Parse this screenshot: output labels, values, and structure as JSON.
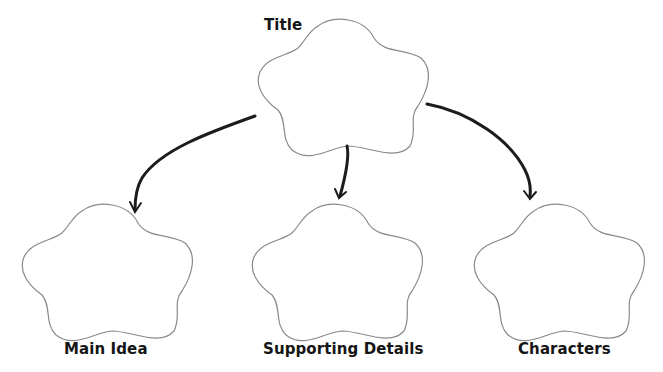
{
  "diagram": {
    "type": "graphic-organizer",
    "colors": {
      "cloud_stroke": "#8a8a8a",
      "arrow": "#1c1c1c",
      "text": "#151515",
      "background": "#ffffff"
    },
    "nodes": [
      {
        "id": "title",
        "label": "Title"
      },
      {
        "id": "main-idea",
        "label": "Main Idea"
      },
      {
        "id": "supporting-details",
        "label": "Supporting Details"
      },
      {
        "id": "characters",
        "label": "Characters"
      }
    ],
    "edges": [
      {
        "from": "title",
        "to": "main-idea"
      },
      {
        "from": "title",
        "to": "supporting-details"
      },
      {
        "from": "title",
        "to": "characters"
      }
    ]
  }
}
